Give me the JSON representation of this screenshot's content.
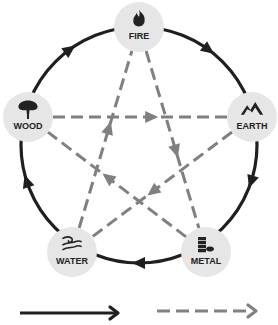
{
  "diagram": {
    "nodes": [
      {
        "id": "fire",
        "label": "FIRE",
        "icon": "flame-icon"
      },
      {
        "id": "earth",
        "label": "EARTH",
        "icon": "mountain-icon"
      },
      {
        "id": "metal",
        "label": "METAL",
        "icon": "coins-icon"
      },
      {
        "id": "water",
        "label": "WATER",
        "icon": "wave-icon"
      },
      {
        "id": "wood",
        "label": "WOOD",
        "icon": "tree-icon"
      }
    ],
    "generating_cycle": [
      [
        "fire",
        "earth"
      ],
      [
        "earth",
        "metal"
      ],
      [
        "metal",
        "water"
      ],
      [
        "water",
        "wood"
      ],
      [
        "wood",
        "fire"
      ]
    ],
    "controlling_cycle": [
      [
        "fire",
        "metal"
      ],
      [
        "metal",
        "wood"
      ],
      [
        "wood",
        "earth"
      ],
      [
        "earth",
        "water"
      ],
      [
        "water",
        "fire"
      ]
    ],
    "colors": {
      "solid": "#1f1f1f",
      "dashed": "#808080",
      "node_fill": "#e6e6e6",
      "label": "#222222"
    },
    "legend": [
      {
        "style": "solid-arrow",
        "meaning": "generating"
      },
      {
        "style": "dashed-arrow",
        "meaning": "controlling"
      }
    ]
  }
}
